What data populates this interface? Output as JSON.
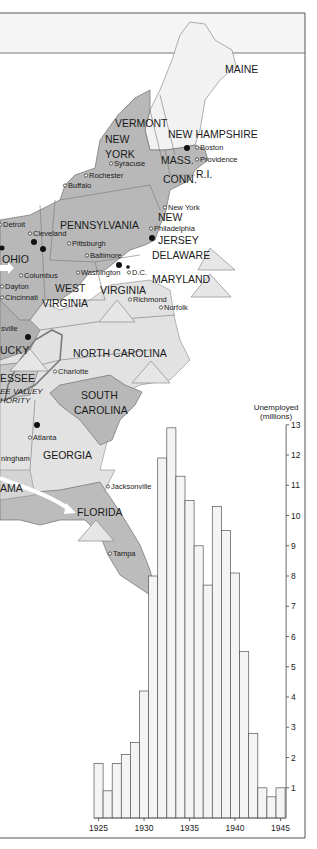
{
  "map": {
    "states": [
      {
        "id": "maine",
        "label": "MAINE",
        "x": 225,
        "y": 73
      },
      {
        "id": "vermont",
        "label": "VERMONT",
        "x": 115,
        "y": 127
      },
      {
        "id": "new-york-1",
        "label": "NEW",
        "x": 105,
        "y": 143
      },
      {
        "id": "new-york-2",
        "label": "YORK",
        "x": 105,
        "y": 158
      },
      {
        "id": "new-hampshire",
        "label": "NEW HAMPSHIRE",
        "x": 168,
        "y": 138
      },
      {
        "id": "mass",
        "label": "MASS.",
        "x": 161,
        "y": 164
      },
      {
        "id": "conn",
        "label": "CONN.",
        "x": 163,
        "y": 183
      },
      {
        "id": "ri",
        "label": "R.I.",
        "x": 196,
        "y": 178
      },
      {
        "id": "pennsylvania",
        "label": "PENNSYLVANIA",
        "x": 60,
        "y": 229
      },
      {
        "id": "new-jersey-1",
        "label": "NEW",
        "x": 158,
        "y": 221
      },
      {
        "id": "new-jersey-2",
        "label": "JERSEY",
        "x": 158,
        "y": 244
      },
      {
        "id": "ohio",
        "label": "OHIO",
        "x": 2,
        "y": 263
      },
      {
        "id": "delaware",
        "label": "DELAWARE",
        "x": 152,
        "y": 259
      },
      {
        "id": "maryland",
        "label": "MARYLAND",
        "x": 152,
        "y": 283
      },
      {
        "id": "west-virginia-1",
        "label": "WEST",
        "x": 55,
        "y": 292
      },
      {
        "id": "west-virginia-2",
        "label": "VIRGINIA",
        "x": 42,
        "y": 307
      },
      {
        "id": "virginia",
        "label": "VIRGINIA",
        "x": 100,
        "y": 294
      },
      {
        "id": "kentucky",
        "label": "UCKY",
        "x": 0,
        "y": 354
      },
      {
        "id": "north-carolina",
        "label": "NORTH CAROLINA",
        "x": 73,
        "y": 357
      },
      {
        "id": "tennessee",
        "label": "ESSEE",
        "x": 0,
        "y": 382
      },
      {
        "id": "south-carolina-1",
        "label": "SOUTH",
        "x": 81,
        "y": 399
      },
      {
        "id": "south-carolina-2",
        "label": "CAROLINA",
        "x": 74,
        "y": 414
      },
      {
        "id": "georgia",
        "label": "GEORGIA",
        "x": 43,
        "y": 459
      },
      {
        "id": "alabama",
        "label": "AMA",
        "x": 0,
        "y": 492
      },
      {
        "id": "florida",
        "label": "FLORIDA",
        "x": 77,
        "y": 516
      }
    ],
    "cities": [
      {
        "id": "boston",
        "label": "Boston",
        "x": 199,
        "y": 150
      },
      {
        "id": "providence",
        "label": "Providence",
        "x": 199,
        "y": 162
      },
      {
        "id": "syracuse",
        "label": "Syracuse",
        "x": 113,
        "y": 166
      },
      {
        "id": "rochester",
        "label": "Rochester",
        "x": 88,
        "y": 178
      },
      {
        "id": "buffalo",
        "label": "Buffalo",
        "x": 67,
        "y": 188
      },
      {
        "id": "new-york-city",
        "label": "New York",
        "x": 167,
        "y": 210
      },
      {
        "id": "philadelphia",
        "label": "Philadelphia",
        "x": 153,
        "y": 231
      },
      {
        "id": "detroit",
        "label": "Detroit",
        "x": 2,
        "y": 227
      },
      {
        "id": "cleveland",
        "label": "Cleveland",
        "x": 32,
        "y": 236
      },
      {
        "id": "pittsburgh",
        "label": "Pittsburgh",
        "x": 71,
        "y": 246
      },
      {
        "id": "baltimore",
        "label": "Baltimore",
        "x": 89,
        "y": 258
      },
      {
        "id": "washington",
        "label": "Washington",
        "x": 80,
        "y": 275
      },
      {
        "id": "dc",
        "label": "D.C.",
        "x": 131,
        "y": 275
      },
      {
        "id": "columbus",
        "label": "Columbus",
        "x": 23,
        "y": 278
      },
      {
        "id": "dayton",
        "label": "Dayton",
        "x": 4,
        "y": 289
      },
      {
        "id": "cincinnati",
        "label": "Cincinnati",
        "x": 4,
        "y": 300
      },
      {
        "id": "richmond",
        "label": "Richmond",
        "x": 132,
        "y": 302
      },
      {
        "id": "norfolk",
        "label": "Norfolk",
        "x": 163,
        "y": 310
      },
      {
        "id": "louisville",
        "label": "sville",
        "x": 0,
        "y": 331
      },
      {
        "id": "charlotte",
        "label": "Charlotte",
        "x": 57,
        "y": 374
      },
      {
        "id": "atlanta",
        "label": "Atlanta",
        "x": 32,
        "y": 440
      },
      {
        "id": "birmingham",
        "label": "ningham",
        "x": 0,
        "y": 461
      },
      {
        "id": "jacksonville",
        "label": "Jacksonville",
        "x": 110,
        "y": 489
      },
      {
        "id": "tampa",
        "label": "Tampa",
        "x": 112,
        "y": 556
      }
    ],
    "tva_label_1": "EE VALLEY",
    "tva_label_2": "HORITY"
  },
  "chart_data": {
    "type": "bar",
    "title": "",
    "ylabel": "Unemployed (millions)",
    "ylabel_line1": "Unemployed",
    "ylabel_line2": "(millions)",
    "xlabel": "",
    "categories": [
      "1925",
      "1926",
      "1927",
      "1928",
      "1929",
      "1930",
      "1931",
      "1932",
      "1933",
      "1934",
      "1935",
      "1936",
      "1937",
      "1938",
      "1939",
      "1940",
      "1941",
      "1942",
      "1943",
      "1944",
      "1945"
    ],
    "values": [
      1.8,
      0.9,
      1.8,
      2.1,
      2.5,
      4.2,
      8.0,
      11.9,
      12.9,
      11.3,
      10.5,
      9.0,
      7.7,
      10.3,
      9.5,
      8.1,
      5.5,
      2.8,
      1.0,
      0.7,
      1.0
    ],
    "x_tick_labels": [
      "1925",
      "1930",
      "1935",
      "1940",
      "1945"
    ],
    "y_ticks": [
      1,
      2,
      3,
      4,
      5,
      6,
      7,
      8,
      9,
      10,
      11,
      12,
      13
    ],
    "ylim": [
      0,
      13
    ],
    "grid": false,
    "legend": null,
    "y_axis_position": "right",
    "bar_fill": "#f4f4f4",
    "bar_stroke": "#555555"
  },
  "colors": {
    "industrial_gray": "#b4b4b4",
    "light_gray": "#e0e0e0",
    "water": "#ffffff",
    "border": "#6e6e6e",
    "frame": "#555555"
  }
}
